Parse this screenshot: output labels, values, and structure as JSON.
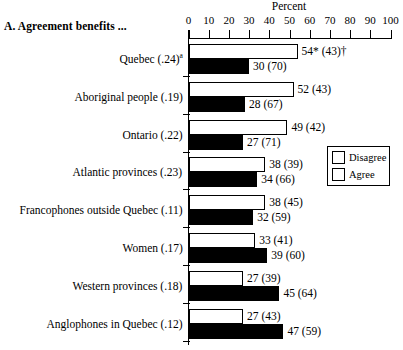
{
  "panel": {
    "title": "A.  Agreement benefits ..."
  },
  "axis": {
    "title": "Percent",
    "tick_labels": [
      "0",
      "10",
      "20",
      "30",
      "40",
      "50",
      "60",
      "70",
      "80",
      "90",
      "100"
    ]
  },
  "legend": {
    "items": [
      {
        "label": "Disagree",
        "color": "#000000"
      },
      {
        "label": "Agree",
        "color": "#ffffff"
      }
    ]
  },
  "chart_data": {
    "type": "bar",
    "title": "A.  Agreement benefits ...",
    "xlabel": "Percent",
    "ylabel": "",
    "xlim": [
      0,
      100
    ],
    "grid": false,
    "orientation": "horizontal",
    "legend_position": "right-middle",
    "categories": [
      "Quebec (.24)a",
      "Aboriginal people (.19)",
      "Ontario (.22)",
      "Atlantic provinces (.23)",
      "Francophones outside Quebec (.11)",
      "Women (.17)",
      "Western provinces (.18)",
      "Anglophones in Quebec (.12)"
    ],
    "series": [
      {
        "name": "Agree",
        "color": "#ffffff",
        "values": [
          54,
          52,
          49,
          38,
          38,
          33,
          27,
          27
        ],
        "labels": [
          "54* (43)†",
          "52 (43)",
          "49 (42)",
          "38 (39)",
          "38 (45)",
          "33 (41)",
          "27 (39)",
          "27 (43)"
        ]
      },
      {
        "name": "Disagree",
        "color": "#000000",
        "values": [
          30,
          28,
          27,
          34,
          32,
          39,
          45,
          47
        ],
        "labels": [
          "30 (70)",
          "28 (67)",
          "27 (71)",
          "34 (66)",
          "32 (59)",
          "39 (60)",
          "45 (64)",
          "47 (59)"
        ]
      }
    ],
    "groups": [
      {
        "label_main": "Quebec (.24)",
        "label_sup": "a",
        "agree_value": 54,
        "agree_label": "54* (43)†",
        "disagree_value": 30,
        "disagree_label": "30 (70)"
      },
      {
        "label_main": "Aboriginal people (.19)",
        "label_sup": "",
        "agree_value": 52,
        "agree_label": "52 (43)",
        "disagree_value": 28,
        "disagree_label": "28 (67)"
      },
      {
        "label_main": "Ontario (.22)",
        "label_sup": "",
        "agree_value": 49,
        "agree_label": "49 (42)",
        "disagree_value": 27,
        "disagree_label": "27 (71)"
      },
      {
        "label_main": "Atlantic provinces (.23)",
        "label_sup": "",
        "agree_value": 38,
        "agree_label": "38 (39)",
        "disagree_value": 34,
        "disagree_label": "34 (66)"
      },
      {
        "label_main": "Francophones outside Quebec (.11)",
        "label_sup": "",
        "agree_value": 38,
        "agree_label": "38 (45)",
        "disagree_value": 32,
        "disagree_label": "32 (59)"
      },
      {
        "label_main": "Women (.17)",
        "label_sup": "",
        "agree_value": 33,
        "agree_label": "33 (41)",
        "disagree_value": 39,
        "disagree_label": "39 (60)"
      },
      {
        "label_main": "Western provinces (.18)",
        "label_sup": "",
        "agree_value": 27,
        "agree_label": "27 (39)",
        "disagree_value": 45,
        "disagree_label": "45 (64)"
      },
      {
        "label_main": "Anglophones in Quebec (.12)",
        "label_sup": "",
        "agree_value": 27,
        "agree_label": "27 (43)",
        "disagree_value": 47,
        "disagree_label": "47 (59)"
      }
    ]
  }
}
